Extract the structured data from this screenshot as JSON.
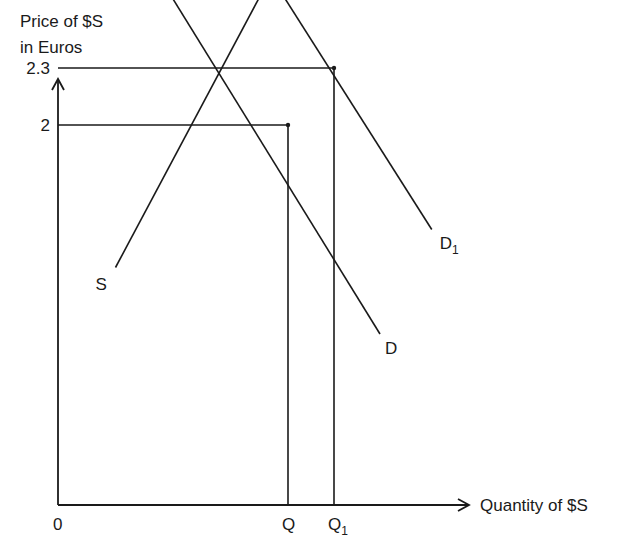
{
  "chart_data": {
    "type": "line",
    "title": "",
    "ylabel_lines": [
      "Price of $S",
      "in Euros"
    ],
    "xlabel": "Quantity of $S",
    "origin_label": "0",
    "y_ticks": [
      {
        "label": "2.3",
        "value": 2.3
      },
      {
        "label": "2",
        "value": 2
      }
    ],
    "x_ticks": [
      {
        "label": "Q",
        "sub": "",
        "value": 4.0
      },
      {
        "label": "Q",
        "sub": "1",
        "value": 4.8
      }
    ],
    "xlim": [
      0,
      5.6
    ],
    "ylim": [
      0,
      4.2
    ],
    "series": [
      {
        "name": "S",
        "label_start": "S",
        "label_end": "S",
        "points": [
          [
            1.0,
            1.25
          ],
          [
            5.4,
            3.75
          ]
        ]
      },
      {
        "name": "D",
        "label_start": "D",
        "label_end": "D",
        "points": [
          [
            0.7,
            3.3
          ],
          [
            5.6,
            0.9
          ]
        ]
      },
      {
        "name": "D1",
        "label_start": "D",
        "label_start_sub": "1",
        "label_end": "D",
        "label_end_sub": "1",
        "points": [
          [
            1.25,
            3.95
          ],
          [
            6.5,
            1.45
          ]
        ]
      }
    ],
    "equilibria": [
      {
        "x": 4.0,
        "y": 2.0
      },
      {
        "x": 4.8,
        "y": 2.3
      }
    ]
  }
}
